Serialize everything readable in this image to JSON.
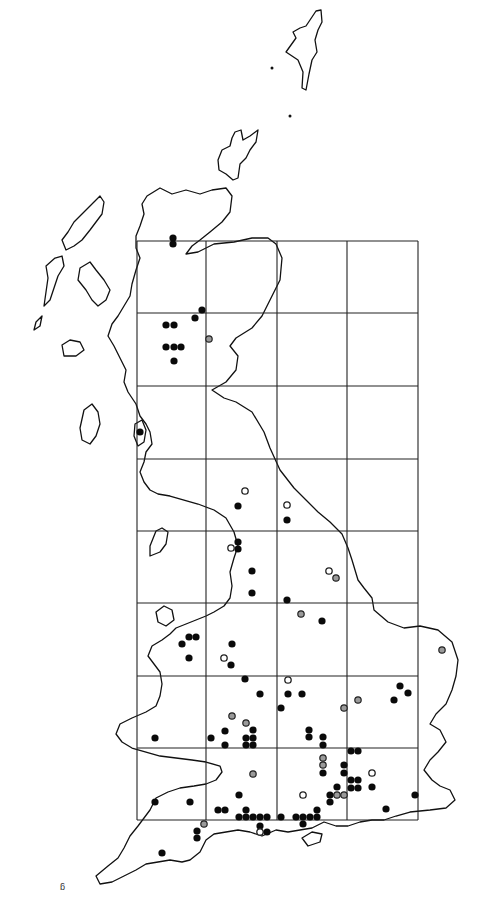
{
  "map": {
    "type": "species distribution map",
    "region": "Great Britain",
    "width": 480,
    "height": 903,
    "colors": {
      "background": "#ffffff",
      "outline": "#111111",
      "grid": "#222222",
      "filled_dot": "#0a0a0a",
      "grey_dot": "#9a9a9a",
      "open_dot": "#ffffff"
    },
    "legend_symbols": [
      {
        "key": "filled",
        "shape": "filled-circle"
      },
      {
        "key": "grey",
        "shape": "grey-circle"
      },
      {
        "key": "open",
        "shape": "open-circle"
      }
    ],
    "grid_lines": {
      "vertical_x": [
        137,
        206,
        277,
        347,
        418
      ],
      "horizontal_y": [
        241,
        313,
        386,
        459,
        531,
        603,
        676,
        748,
        820
      ]
    },
    "dots": [
      {
        "x": 173,
        "y": 238,
        "type": "filled"
      },
      {
        "x": 173,
        "y": 244,
        "type": "filled"
      },
      {
        "x": 202,
        "y": 310,
        "type": "filled"
      },
      {
        "x": 195,
        "y": 318,
        "type": "filled"
      },
      {
        "x": 166,
        "y": 325,
        "type": "filled"
      },
      {
        "x": 174,
        "y": 325,
        "type": "filled"
      },
      {
        "x": 209,
        "y": 339,
        "type": "grey"
      },
      {
        "x": 166,
        "y": 347,
        "type": "filled"
      },
      {
        "x": 174,
        "y": 347,
        "type": "filled"
      },
      {
        "x": 181,
        "y": 347,
        "type": "filled"
      },
      {
        "x": 174,
        "y": 361,
        "type": "filled"
      },
      {
        "x": 140,
        "y": 432,
        "type": "filled"
      },
      {
        "x": 245,
        "y": 491,
        "type": "open"
      },
      {
        "x": 238,
        "y": 506,
        "type": "filled"
      },
      {
        "x": 287,
        "y": 505,
        "type": "open"
      },
      {
        "x": 287,
        "y": 520,
        "type": "filled"
      },
      {
        "x": 238,
        "y": 542,
        "type": "filled"
      },
      {
        "x": 238,
        "y": 549,
        "type": "filled"
      },
      {
        "x": 231,
        "y": 548,
        "type": "open"
      },
      {
        "x": 252,
        "y": 571,
        "type": "filled"
      },
      {
        "x": 329,
        "y": 571,
        "type": "open"
      },
      {
        "x": 336,
        "y": 578,
        "type": "grey"
      },
      {
        "x": 252,
        "y": 593,
        "type": "filled"
      },
      {
        "x": 287,
        "y": 600,
        "type": "filled"
      },
      {
        "x": 301,
        "y": 614,
        "type": "grey"
      },
      {
        "x": 322,
        "y": 621,
        "type": "filled"
      },
      {
        "x": 442,
        "y": 650,
        "type": "grey"
      },
      {
        "x": 189,
        "y": 637,
        "type": "filled"
      },
      {
        "x": 196,
        "y": 637,
        "type": "filled"
      },
      {
        "x": 182,
        "y": 644,
        "type": "filled"
      },
      {
        "x": 232,
        "y": 644,
        "type": "filled"
      },
      {
        "x": 189,
        "y": 658,
        "type": "filled"
      },
      {
        "x": 224,
        "y": 658,
        "type": "open"
      },
      {
        "x": 231,
        "y": 665,
        "type": "filled"
      },
      {
        "x": 245,
        "y": 679,
        "type": "filled"
      },
      {
        "x": 288,
        "y": 680,
        "type": "open"
      },
      {
        "x": 288,
        "y": 694,
        "type": "filled"
      },
      {
        "x": 302,
        "y": 694,
        "type": "filled"
      },
      {
        "x": 400,
        "y": 686,
        "type": "filled"
      },
      {
        "x": 408,
        "y": 693,
        "type": "filled"
      },
      {
        "x": 260,
        "y": 694,
        "type": "filled"
      },
      {
        "x": 281,
        "y": 708,
        "type": "filled"
      },
      {
        "x": 358,
        "y": 700,
        "type": "grey"
      },
      {
        "x": 344,
        "y": 708,
        "type": "grey"
      },
      {
        "x": 394,
        "y": 700,
        "type": "filled"
      },
      {
        "x": 232,
        "y": 716,
        "type": "grey"
      },
      {
        "x": 246,
        "y": 723,
        "type": "grey"
      },
      {
        "x": 155,
        "y": 738,
        "type": "filled"
      },
      {
        "x": 211,
        "y": 738,
        "type": "filled"
      },
      {
        "x": 225,
        "y": 731,
        "type": "filled"
      },
      {
        "x": 253,
        "y": 730,
        "type": "filled"
      },
      {
        "x": 253,
        "y": 738,
        "type": "filled"
      },
      {
        "x": 246,
        "y": 738,
        "type": "filled"
      },
      {
        "x": 225,
        "y": 745,
        "type": "filled"
      },
      {
        "x": 246,
        "y": 745,
        "type": "filled"
      },
      {
        "x": 253,
        "y": 745,
        "type": "filled"
      },
      {
        "x": 309,
        "y": 730,
        "type": "filled"
      },
      {
        "x": 309,
        "y": 737,
        "type": "filled"
      },
      {
        "x": 323,
        "y": 737,
        "type": "filled"
      },
      {
        "x": 323,
        "y": 745,
        "type": "filled"
      },
      {
        "x": 323,
        "y": 758,
        "type": "grey"
      },
      {
        "x": 323,
        "y": 765,
        "type": "grey"
      },
      {
        "x": 323,
        "y": 773,
        "type": "filled"
      },
      {
        "x": 351,
        "y": 751,
        "type": "filled"
      },
      {
        "x": 358,
        "y": 751,
        "type": "filled"
      },
      {
        "x": 253,
        "y": 774,
        "type": "grey"
      },
      {
        "x": 344,
        "y": 765,
        "type": "filled"
      },
      {
        "x": 344,
        "y": 773,
        "type": "filled"
      },
      {
        "x": 372,
        "y": 773,
        "type": "open"
      },
      {
        "x": 351,
        "y": 780,
        "type": "filled"
      },
      {
        "x": 358,
        "y": 780,
        "type": "filled"
      },
      {
        "x": 351,
        "y": 788,
        "type": "filled"
      },
      {
        "x": 358,
        "y": 788,
        "type": "filled"
      },
      {
        "x": 372,
        "y": 787,
        "type": "filled"
      },
      {
        "x": 337,
        "y": 787,
        "type": "filled"
      },
      {
        "x": 337,
        "y": 795,
        "type": "grey"
      },
      {
        "x": 344,
        "y": 795,
        "type": "grey"
      },
      {
        "x": 330,
        "y": 795,
        "type": "filled"
      },
      {
        "x": 330,
        "y": 802,
        "type": "filled"
      },
      {
        "x": 303,
        "y": 795,
        "type": "open"
      },
      {
        "x": 239,
        "y": 795,
        "type": "filled"
      },
      {
        "x": 386,
        "y": 809,
        "type": "filled"
      },
      {
        "x": 415,
        "y": 795,
        "type": "filled"
      },
      {
        "x": 155,
        "y": 802,
        "type": "filled"
      },
      {
        "x": 190,
        "y": 802,
        "type": "filled"
      },
      {
        "x": 218,
        "y": 810,
        "type": "filled"
      },
      {
        "x": 225,
        "y": 810,
        "type": "filled"
      },
      {
        "x": 246,
        "y": 810,
        "type": "filled"
      },
      {
        "x": 239,
        "y": 817,
        "type": "filled"
      },
      {
        "x": 246,
        "y": 817,
        "type": "filled"
      },
      {
        "x": 253,
        "y": 817,
        "type": "filled"
      },
      {
        "x": 260,
        "y": 817,
        "type": "filled"
      },
      {
        "x": 267,
        "y": 817,
        "type": "filled"
      },
      {
        "x": 281,
        "y": 817,
        "type": "filled"
      },
      {
        "x": 296,
        "y": 817,
        "type": "filled"
      },
      {
        "x": 303,
        "y": 817,
        "type": "filled"
      },
      {
        "x": 310,
        "y": 817,
        "type": "filled"
      },
      {
        "x": 317,
        "y": 810,
        "type": "filled"
      },
      {
        "x": 317,
        "y": 817,
        "type": "filled"
      },
      {
        "x": 303,
        "y": 824,
        "type": "filled"
      },
      {
        "x": 260,
        "y": 826,
        "type": "filled"
      },
      {
        "x": 260,
        "y": 832,
        "type": "open"
      },
      {
        "x": 267,
        "y": 832,
        "type": "filled"
      },
      {
        "x": 204,
        "y": 824,
        "type": "grey"
      },
      {
        "x": 197,
        "y": 831,
        "type": "filled"
      },
      {
        "x": 197,
        "y": 838,
        "type": "filled"
      },
      {
        "x": 162,
        "y": 853,
        "type": "filled"
      }
    ]
  }
}
